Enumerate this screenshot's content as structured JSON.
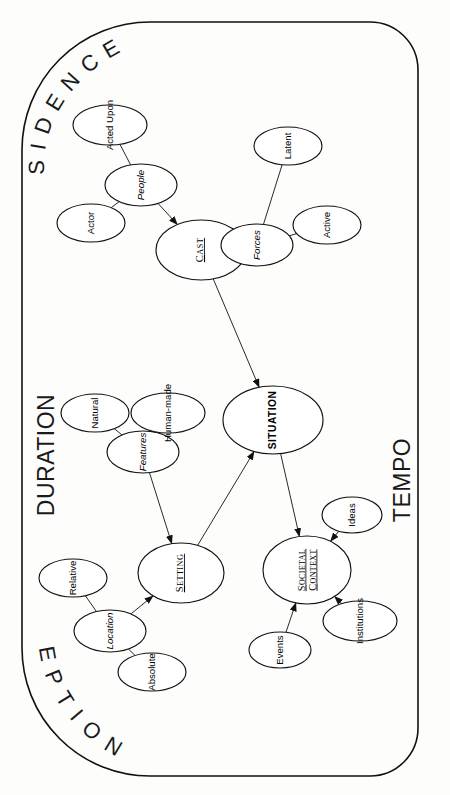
{
  "diagram": {
    "frame": {
      "top_label": "SUBSIDENCE",
      "bottom_label": "INCEPTION",
      "left_label": "DURATION",
      "right_label": "TEMPO"
    },
    "colors": {
      "background": "#fdfdfc",
      "stroke": "#111111",
      "node_fill": "#ffffff",
      "text": "#000000"
    },
    "nodes": [
      {
        "id": "situation",
        "label": "SITUATION",
        "level": "root",
        "cx": 273,
        "cy": 420,
        "rx": 34,
        "ry": 50,
        "rotation": -90
      },
      {
        "id": "cast",
        "label": "CAST",
        "level": "major",
        "cx": 201,
        "cy": 250,
        "rx": 30,
        "ry": 45,
        "rotation": -90,
        "underline": true
      },
      {
        "id": "setting",
        "label": "SETTING",
        "level": "major",
        "cx": 181,
        "cy": 573,
        "rx": 30,
        "ry": 43,
        "rotation": -90,
        "underline": true
      },
      {
        "id": "societal-context",
        "label": "SOCIETAL CONTEXT",
        "level": "major",
        "cx": 307,
        "cy": 570,
        "rx": 34,
        "ry": 44,
        "rotation": -90,
        "underline": true,
        "two_line": true
      },
      {
        "id": "people",
        "label": "People",
        "level": "mid",
        "cx": 141,
        "cy": 185,
        "rx": 21,
        "ry": 36,
        "rotation": -90
      },
      {
        "id": "forces",
        "label": "Forces",
        "level": "mid",
        "cx": 257,
        "cy": 245,
        "rx": 21,
        "ry": 36,
        "rotation": -90
      },
      {
        "id": "features",
        "label": "Features",
        "level": "mid",
        "cx": 143,
        "cy": 452,
        "rx": 21,
        "ry": 36,
        "rotation": -90
      },
      {
        "id": "location",
        "label": "Location",
        "level": "mid",
        "cx": 110,
        "cy": 631,
        "rx": 21,
        "ry": 36,
        "rotation": -90
      },
      {
        "id": "acted-upon",
        "label": "Acted Upon",
        "level": "leaf",
        "cx": 110,
        "cy": 125,
        "rx": 20,
        "ry": 37,
        "rotation": -90
      },
      {
        "id": "actor",
        "label": "Actor",
        "level": "leaf",
        "cx": 91,
        "cy": 223,
        "rx": 19,
        "ry": 34,
        "rotation": -90
      },
      {
        "id": "latent",
        "label": "Latent",
        "level": "leaf",
        "cx": 288,
        "cy": 146,
        "rx": 19,
        "ry": 34,
        "rotation": -90
      },
      {
        "id": "active",
        "label": "Active",
        "level": "leaf",
        "cx": 327,
        "cy": 225,
        "rx": 19,
        "ry": 34,
        "rotation": -90
      },
      {
        "id": "natural",
        "label": "Natural",
        "level": "leaf",
        "cx": 95,
        "cy": 413,
        "rx": 19,
        "ry": 34,
        "rotation": -90
      },
      {
        "id": "human-made",
        "label": "Human-made",
        "level": "leaf",
        "cx": 168,
        "cy": 413,
        "rx": 20,
        "ry": 37,
        "rotation": -90
      },
      {
        "id": "relative",
        "label": "Relative",
        "level": "leaf",
        "cx": 73,
        "cy": 578,
        "rx": 19,
        "ry": 34,
        "rotation": -90
      },
      {
        "id": "absolute",
        "label": "Absolute",
        "level": "leaf",
        "cx": 152,
        "cy": 672,
        "rx": 19,
        "ry": 34,
        "rotation": -90
      },
      {
        "id": "ideas",
        "label": "Ideas",
        "level": "leaf",
        "cx": 352,
        "cy": 515,
        "rx": 18,
        "ry": 30,
        "rotation": -90
      },
      {
        "id": "institutions",
        "label": "Institutions",
        "level": "leaf",
        "cx": 360,
        "cy": 621,
        "rx": 20,
        "ry": 37,
        "rotation": -90
      },
      {
        "id": "events",
        "label": "Events",
        "level": "leaf",
        "cx": 280,
        "cy": 650,
        "rx": 18,
        "ry": 31,
        "rotation": -90
      }
    ],
    "edges": [
      {
        "from": "acted-upon",
        "to": "people",
        "arrow": false
      },
      {
        "from": "actor",
        "to": "people",
        "arrow": false
      },
      {
        "from": "people",
        "to": "cast",
        "arrow": true
      },
      {
        "from": "latent",
        "to": "forces",
        "arrow": false
      },
      {
        "from": "active",
        "to": "forces",
        "arrow": false
      },
      {
        "from": "forces",
        "to": "cast",
        "arrow": true
      },
      {
        "from": "cast",
        "to": "situation",
        "arrow": true
      },
      {
        "from": "natural",
        "to": "features",
        "arrow": false
      },
      {
        "from": "human-made",
        "to": "features",
        "arrow": false
      },
      {
        "from": "features",
        "to": "setting",
        "arrow": true
      },
      {
        "from": "relative",
        "to": "location",
        "arrow": false
      },
      {
        "from": "absolute",
        "to": "location",
        "arrow": false
      },
      {
        "from": "location",
        "to": "setting",
        "arrow": true
      },
      {
        "from": "setting",
        "to": "situation",
        "arrow": true
      },
      {
        "from": "situation",
        "to": "societal-context",
        "arrow": true
      },
      {
        "from": "ideas",
        "to": "societal-context",
        "arrow": true
      },
      {
        "from": "institutions",
        "to": "societal-context",
        "arrow": true
      },
      {
        "from": "events",
        "to": "societal-context",
        "arrow": true
      }
    ]
  }
}
